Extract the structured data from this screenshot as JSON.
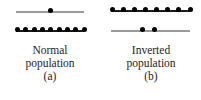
{
  "figure": {
    "background_color": "#ffffff",
    "dot_color": "#000000",
    "gray_line_color": "#9a9a9a",
    "black_line_color": "#1a1a1a",
    "text_color": "#1c1c1c"
  },
  "panels": [
    {
      "id": "a",
      "caption_line1": "Normal",
      "caption_line2": "population",
      "caption_tag": "(a)",
      "upper_level": {
        "line_style": "gray",
        "dot_count": 1,
        "dot_positions_pct": [
          50
        ]
      },
      "lower_level": {
        "line_style": "black",
        "dot_count": 9,
        "dot_positions_pct": [
          2,
          14.25,
          26.5,
          38.75,
          51,
          63.25,
          75.5,
          87.75,
          100
        ]
      }
    },
    {
      "id": "b",
      "caption_line1": "Inverted",
      "caption_line2": "population",
      "caption_tag": "(b)",
      "upper_level": {
        "line_style": "black",
        "dot_count": 8,
        "dot_positions_pct": [
          2,
          16,
          30,
          44,
          58,
          72,
          86,
          100
        ]
      },
      "lower_level": {
        "line_style": "gray",
        "dot_count": 2,
        "dot_positions_pct": [
          40,
          55
        ]
      }
    }
  ]
}
